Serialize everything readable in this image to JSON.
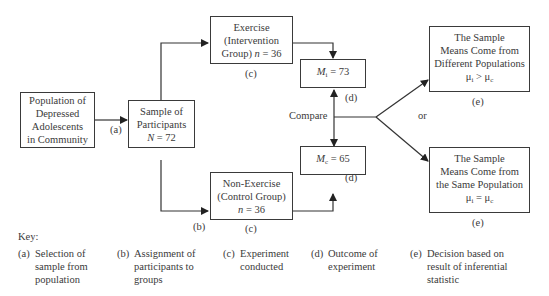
{
  "nodes": {
    "population": {
      "lines": [
        "Population of",
        "Depressed",
        "Adolescents",
        "in Community"
      ]
    },
    "sample": {
      "lines": [
        "Sample of",
        "Participants"
      ],
      "n_label": "N",
      "n_value": "= 72"
    },
    "exercise": {
      "lines": [
        "Exercise",
        "(Intervention"
      ],
      "last_prefix": "Group) ",
      "n_label": "n",
      "n_value": " = 36"
    },
    "control": {
      "lines": [
        "Non-Exercise",
        "(Control Group)"
      ],
      "n_label": "n",
      "n_value": " = 36"
    },
    "mean_i": {
      "symbol": "M",
      "sub": "i",
      "value": " = 73"
    },
    "mean_c": {
      "symbol": "M",
      "sub": "c",
      "value": " = 65"
    },
    "different": {
      "lines": [
        "The Sample",
        "Means Come from",
        "Different Populations"
      ],
      "formula": "μ",
      "sub1": "i",
      "op": " > μ",
      "sub2": "c"
    },
    "same": {
      "lines": [
        "The Sample",
        "Means Come from",
        "the Same Population"
      ],
      "formula": "μ",
      "sub1": "i",
      "op": " = μ",
      "sub2": "c"
    }
  },
  "labels": {
    "a": "(a)",
    "b": "(b)",
    "c_top": "(c)",
    "c_bottom": "(c)",
    "d_top": "(d)",
    "d_bottom": "(d)",
    "e_top": "(e)",
    "e_bottom": "(e)",
    "compare": "Compare",
    "or": "or"
  },
  "key": {
    "title": "Key:",
    "items": [
      {
        "tag": "(a)",
        "lines": [
          "Selection of",
          "sample from",
          "population"
        ]
      },
      {
        "tag": "(b)",
        "lines": [
          "Assignment of",
          "participants to",
          "groups"
        ]
      },
      {
        "tag": "(c)",
        "lines": [
          "Experiment",
          "conducted"
        ]
      },
      {
        "tag": "(d)",
        "lines": [
          "Outcome of",
          "experiment"
        ]
      },
      {
        "tag": "(e)",
        "lines": [
          "Decision based on",
          "result of inferential",
          "statistic"
        ]
      }
    ]
  }
}
